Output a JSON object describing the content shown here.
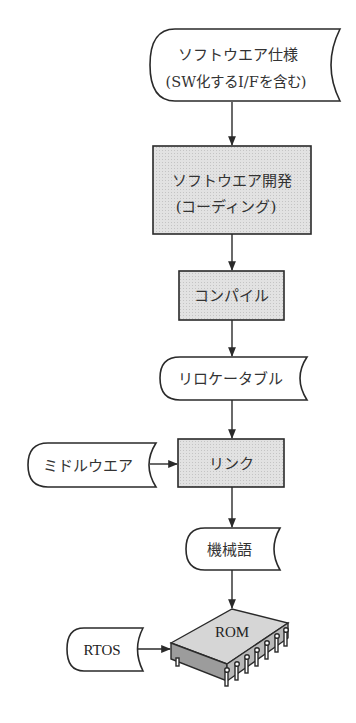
{
  "diagram": {
    "type": "flowchart",
    "colors": {
      "stroke": "#2a2a2a",
      "process_fill": "#dcdcdc",
      "data_fill": "#ffffff",
      "chip_top": "#d8d8d8",
      "chip_side": "#9a9a9a",
      "text": "#333333"
    },
    "nodes": {
      "spec": {
        "shape": "stored-data",
        "line1": "ソフトウエア仕様",
        "line2": "(SW化するI/Fを含む)"
      },
      "dev": {
        "shape": "process",
        "line1": "ソフトウエア開発",
        "line2": "(コーディング)"
      },
      "compile": {
        "shape": "process",
        "label": "コンパイル"
      },
      "relocatable": {
        "shape": "stored-data",
        "label": "リロケータブル"
      },
      "middleware": {
        "shape": "stored-data",
        "label": "ミドルウエア"
      },
      "link": {
        "shape": "process",
        "label": "リンク"
      },
      "machine_code": {
        "shape": "stored-data",
        "label": "機械語"
      },
      "rtos": {
        "shape": "stored-data",
        "label": "RTOS"
      },
      "rom": {
        "shape": "chip",
        "label": "ROM"
      }
    },
    "edges": [
      {
        "from": "spec",
        "to": "dev"
      },
      {
        "from": "dev",
        "to": "compile"
      },
      {
        "from": "compile",
        "to": "relocatable"
      },
      {
        "from": "relocatable",
        "to": "link"
      },
      {
        "from": "middleware",
        "to": "link"
      },
      {
        "from": "link",
        "to": "machine_code"
      },
      {
        "from": "machine_code",
        "to": "rom"
      },
      {
        "from": "rtos",
        "to": "rom"
      }
    ]
  }
}
